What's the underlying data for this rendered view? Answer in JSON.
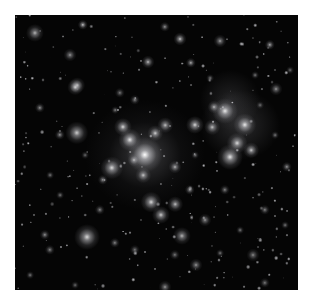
{
  "image": {
    "subject": "galaxy cluster deep field",
    "background_color": "#050505",
    "border_color": "#ffffff",
    "frame": {
      "x": 15,
      "y": 15,
      "width": 283,
      "height": 275
    }
  },
  "galaxies": [
    [
      130,
      140,
      14,
      1.0
    ],
    [
      115,
      125,
      9,
      0.9
    ],
    [
      108,
      112,
      7,
      0.85
    ],
    [
      140,
      118,
      6,
      0.8
    ],
    [
      150,
      110,
      6,
      0.75
    ],
    [
      97,
      153,
      9,
      0.85
    ],
    [
      180,
      110,
      7,
      0.85
    ],
    [
      62,
      118,
      9,
      0.8
    ],
    [
      210,
      96,
      10,
      0.9
    ],
    [
      222,
      128,
      8,
      0.85
    ],
    [
      230,
      110,
      9,
      0.9
    ],
    [
      215,
      142,
      10,
      0.9
    ],
    [
      236,
      135,
      6,
      0.8
    ],
    [
      197,
      112,
      6,
      0.75
    ],
    [
      136,
      187,
      8,
      0.85
    ],
    [
      146,
      200,
      7,
      0.8
    ],
    [
      160,
      189,
      6,
      0.75
    ],
    [
      72,
      222,
      10,
      0.85
    ],
    [
      167,
      221,
      7,
      0.7
    ],
    [
      62,
      70,
      6,
      0.7
    ],
    [
      60,
      72,
      6,
      0.75
    ],
    [
      165,
      24,
      5,
      0.8
    ],
    [
      133,
      47,
      5,
      0.75
    ],
    [
      176,
      48,
      4,
      0.7
    ],
    [
      199,
      92,
      5,
      0.7
    ],
    [
      128,
      160,
      6,
      0.75
    ],
    [
      119,
      145,
      5,
      0.7
    ],
    [
      160,
      152,
      5,
      0.7
    ],
    [
      175,
      175,
      4,
      0.65
    ],
    [
      45,
      120,
      4,
      0.6
    ],
    [
      25,
      93,
      4,
      0.6
    ],
    [
      20,
      18,
      7,
      0.7
    ],
    [
      55,
      40,
      5,
      0.6
    ],
    [
      68,
      10,
      4,
      0.8
    ],
    [
      205,
      26,
      5,
      0.65
    ],
    [
      255,
      30,
      4,
      0.7
    ],
    [
      261,
      74,
      5,
      0.6
    ],
    [
      272,
      152,
      4,
      0.6
    ],
    [
      250,
      195,
      4,
      0.55
    ],
    [
      238,
      240,
      5,
      0.55
    ],
    [
      250,
      268,
      4,
      0.5
    ],
    [
      181,
      250,
      5,
      0.6
    ],
    [
      150,
      272,
      5,
      0.6
    ],
    [
      100,
      228,
      4,
      0.55
    ],
    [
      30,
      220,
      4,
      0.6
    ],
    [
      35,
      235,
      4,
      0.55
    ],
    [
      120,
      235,
      4,
      0.5
    ],
    [
      190,
      205,
      5,
      0.6
    ],
    [
      210,
      175,
      4,
      0.55
    ],
    [
      88,
      165,
      4,
      0.6
    ],
    [
      150,
      12,
      4,
      0.6
    ],
    [
      105,
      78,
      4,
      0.5
    ],
    [
      35,
      160,
      3,
      0.5
    ],
    [
      260,
      120,
      3,
      0.5
    ],
    [
      85,
      195,
      4,
      0.55
    ],
    [
      120,
      85,
      4,
      0.55
    ],
    [
      195,
      63,
      3,
      0.5
    ],
    [
      240,
      60,
      3,
      0.5
    ],
    [
      45,
      180,
      3,
      0.5
    ],
    [
      270,
      210,
      3,
      0.5
    ],
    [
      15,
      260,
      3,
      0.5
    ],
    [
      60,
      270,
      3,
      0.45
    ],
    [
      205,
      238,
      3,
      0.5
    ],
    [
      225,
      215,
      3,
      0.5
    ],
    [
      160,
      240,
      4,
      0.5
    ],
    [
      100,
      95,
      3,
      0.5
    ],
    [
      70,
      140,
      3,
      0.45
    ],
    [
      180,
      140,
      3,
      0.5
    ],
    [
      245,
      90,
      3,
      0.45
    ],
    [
      275,
      55,
      3,
      0.45
    ]
  ]
}
